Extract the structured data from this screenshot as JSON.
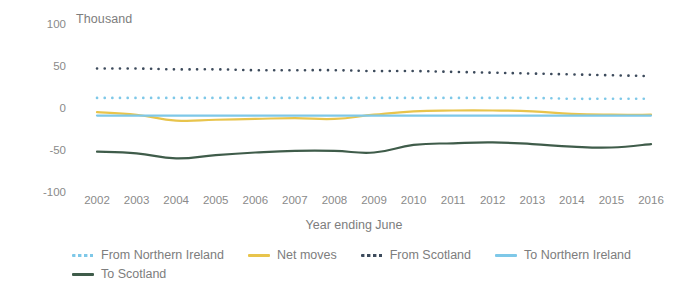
{
  "chart_data": {
    "type": "line",
    "title": "",
    "unit_label": "Thousand",
    "xlabel": "Year ending June",
    "ylabel": "",
    "categories": [
      "2002",
      "2003",
      "2004",
      "2005",
      "2006",
      "2007",
      "2008",
      "2009",
      "2010",
      "2011",
      "2012",
      "2013",
      "2014",
      "2015",
      "2016"
    ],
    "ylim": [
      -100,
      100
    ],
    "yticks": [
      100,
      50,
      0,
      -50,
      -100
    ],
    "grid": false,
    "legend_position": "bottom",
    "series": [
      {
        "name": "From Northern Ireland",
        "style": "dotted",
        "color": "#7ec8e8",
        "values": [
          12,
          12,
          12,
          12,
          12,
          12,
          12,
          12,
          12,
          12,
          12,
          12,
          11,
          11,
          11
        ]
      },
      {
        "name": "Net moves",
        "style": "solid",
        "color": "#e8c44c",
        "values": [
          -5,
          -8,
          -15,
          -14,
          -13,
          -12,
          -13,
          -8,
          -4,
          -3,
          -3,
          -4,
          -7,
          -8,
          -8
        ]
      },
      {
        "name": "From Scotland",
        "style": "dotted",
        "color": "#3d4b5c",
        "values": [
          47,
          47,
          46,
          46,
          45,
          45,
          45,
          44,
          44,
          43,
          42,
          41,
          40,
          39,
          38
        ]
      },
      {
        "name": "To Northern Ireland",
        "style": "solid",
        "color": "#7ec8e8",
        "values": [
          -9,
          -9,
          -9,
          -9,
          -9,
          -9,
          -9,
          -9,
          -9,
          -9,
          -9,
          -9,
          -9,
          -9,
          -9
        ]
      },
      {
        "name": "To Scotland",
        "style": "solid",
        "color": "#3f5c4a",
        "values": [
          -52,
          -54,
          -60,
          -56,
          -53,
          -51,
          -51,
          -53,
          -44,
          -42,
          -41,
          -43,
          -46,
          -47,
          -43
        ]
      }
    ]
  }
}
